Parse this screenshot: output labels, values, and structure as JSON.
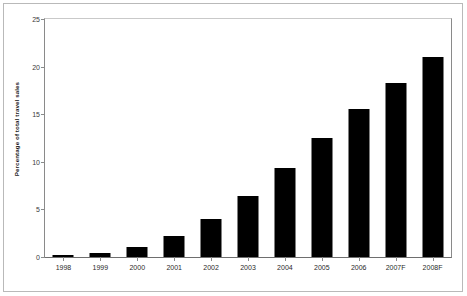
{
  "chart_data": {
    "type": "bar",
    "title": "",
    "xlabel": "",
    "ylabel": "Percentage of total travel sales",
    "categories": [
      "1998",
      "1999",
      "2000",
      "2001",
      "2002",
      "2003",
      "2004",
      "2005",
      "2006",
      "2007F",
      "2008F"
    ],
    "values": [
      0.2,
      0.4,
      1.1,
      2.2,
      4.0,
      6.4,
      9.3,
      12.5,
      15.5,
      18.3,
      21.0
    ],
    "ylim": [
      0,
      25
    ],
    "yticks": [
      0,
      5,
      10,
      15,
      20,
      25
    ],
    "ytick_labels": [
      "0",
      "5",
      "10",
      "15",
      "20",
      "25"
    ],
    "grid": false,
    "legend": null,
    "bar_color": "#000000",
    "axis_color": "#8a8a8a",
    "background_color": "#ffffff"
  }
}
